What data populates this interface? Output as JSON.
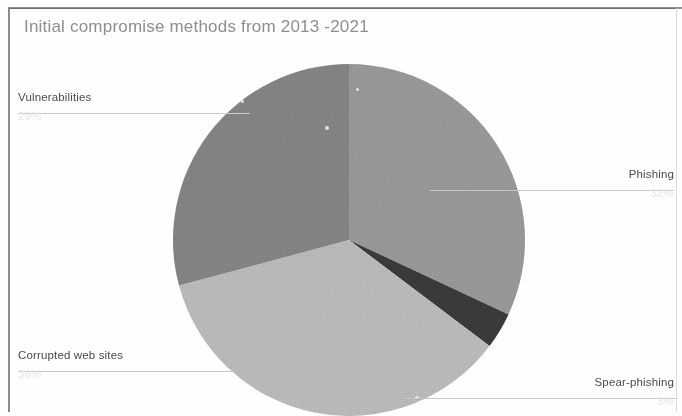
{
  "chart_data": {
    "type": "pie",
    "title": "Initial compromise methods from 2013 -2021",
    "xlabel": "",
    "ylabel": "",
    "legend_position": "none",
    "labels_position": "outside-with-leader-lines",
    "grid": false,
    "categories": [
      "Phishing",
      "Spear-phishing",
      "Corrupted web sites",
      "Vulnerabilities"
    ],
    "values": [
      32,
      3,
      36,
      29
    ],
    "value_unit": "%",
    "start_angle_deg": 0,
    "direction": "clockwise",
    "slices": [
      {
        "label": "Phishing",
        "value": 32,
        "value_text": "32%",
        "start_angle_deg": 0,
        "end_angle_deg": 115,
        "color": "#9d9d9d"
      },
      {
        "label": "Spear-phishing",
        "value": 3,
        "value_text": "3%",
        "start_angle_deg": 115,
        "end_angle_deg": 127,
        "color": "#3c3c3c"
      },
      {
        "label": "Corrupted web sites",
        "value": 36,
        "value_text": "36%",
        "start_angle_deg": 127,
        "end_angle_deg": 255,
        "color": "#c0c0c0"
      },
      {
        "label": "Vulnerabilities",
        "value": 29,
        "value_text": "29%",
        "start_angle_deg": 255,
        "end_angle_deg": 360,
        "color": "#888888"
      }
    ]
  },
  "chart": {
    "title": "Initial compromise methods from 2013 -2021",
    "title_color": "#8e8e8e",
    "background": "#fefefe",
    "frame_color": "#8b8b8b"
  },
  "labels": {
    "vulnerabilities": {
      "text": "Vulnerabilities",
      "percent": "29%"
    },
    "phishing": {
      "text": "Phishing",
      "percent": "32%"
    },
    "corrupted_web_sites": {
      "text": "Corrupted web sites",
      "percent": "36%"
    },
    "spear_phishing": {
      "text": "Spear-phishing",
      "percent": "3%"
    }
  }
}
